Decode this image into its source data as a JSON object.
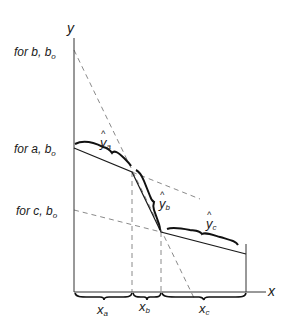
{
  "diagram": {
    "axes": {
      "y_label": "y",
      "x_label": "x"
    },
    "y_intercept_labels": [
      {
        "id": "b",
        "text": "for b, b",
        "sub": "o"
      },
      {
        "id": "a",
        "text": "for a, b",
        "sub": "o"
      },
      {
        "id": "c",
        "text": "for c, b",
        "sub": "o"
      }
    ],
    "segment_labels": [
      {
        "id": "ya",
        "text": "y",
        "hat": "^",
        "sub": "a"
      },
      {
        "id": "yb",
        "text": "y",
        "hat": "^",
        "sub": "b"
      },
      {
        "id": "yc",
        "text": "y",
        "hat": "^",
        "sub": "c"
      }
    ],
    "interval_labels": [
      {
        "id": "xa",
        "text": "x",
        "sub": "a"
      },
      {
        "id": "xb",
        "text": "x",
        "sub": "b"
      },
      {
        "id": "xc",
        "text": "x",
        "sub": "c"
      }
    ],
    "colors": {
      "ink": "#1a1a1a",
      "dashed": "#888888"
    }
  }
}
